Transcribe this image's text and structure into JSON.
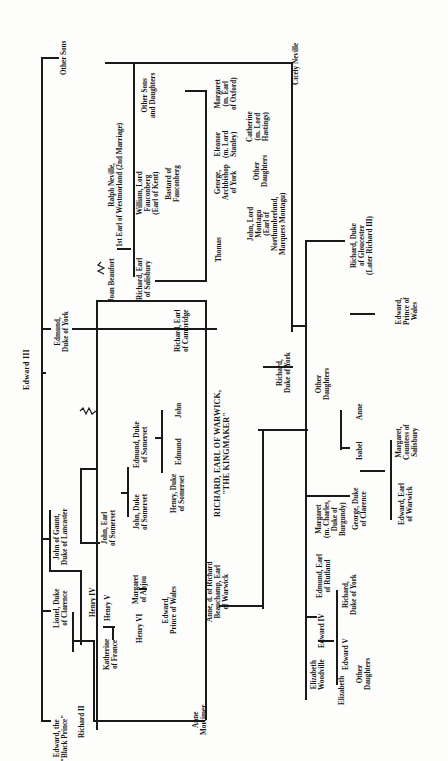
{
  "diagram": {
    "orientation": "rotated 90 degrees counter-clockwise; text reads bottom-to-top",
    "root": "Edward III",
    "people": {
      "edward_iii": "Edward III",
      "other_sons": "Other Sons",
      "edmund_york": "Edmund,\nDuke of York",
      "john_gaunt": "John of Gaunt,\nDuke of Lancaster",
      "lionel": "Lionel, Duke\nof Clarence",
      "black_prince": "Edward, the\n\"Black Prince\"",
      "richard_ii": "Richard II",
      "henry_iv": "Henry IV",
      "henry_v": "Henry V",
      "katherine": "Katherine\nof France",
      "henry_vi": "Henry VI",
      "margaret_anjou": "Margaret\nof Anjou",
      "edward_pow_1": "Edward,\nPrince of Wales",
      "john_somerset": "John, Earl\nof Somerset",
      "john_duke_somerset": "John, Duke\nof Somerset",
      "edmund_duke_somerset": "Edmund, Duke\nof Somerset",
      "henry_duke_somerset": "Henry, Duke\nof Somerset",
      "edmund": "Edmund",
      "john": "John",
      "joan_beaufort": "Joan Beaufort",
      "ralph_neville": "Ralph Neville,\n1st Earl of Westmorland (2nd Marriage)",
      "richard_salisbury": "Richard, Earl\nof Salisbury",
      "william_fauconberg": "William, Lord\nFauconberg\n(Earl of Kent)",
      "bastard_fauconberg": "Bastard of\nFauconberg",
      "other_sons_daughters": "Other Sons\nand Daughters",
      "cecily_neville": "Cicely Neville",
      "thomas": "Thomas",
      "george_archbishop": "George,\nArchbishop\nof York",
      "john_montagu": "John, Lord\nMontagu\n(Earl of\nNorthumberland,\nMarquess Montagu)",
      "eleanor": "Eleanor\n(m. Lord\nStanley)",
      "other_daughters_1": "Other\nDaughters",
      "margaret_oxford": "Margaret\n(m. Earl\nof Oxford)",
      "catherine": "Catherine\n(m. Lord\nHastings)",
      "richard_cambridge": "Richard, Earl\nof Cambridge",
      "anne_mortimer": "Anne\nMortimer",
      "richard_york": "Richard,\nDuke of York",
      "warwick": "RICHARD, EARL OF WARWICK,\n\"THE KINGMAKER\"",
      "anne_beauchamp": "Anne, d. of Richard\nBeauchamp, Earl\nof Warwick",
      "other_daughters_2": "Other\nDaughters",
      "richard_gloucester": "Richard, Duke\nof Gloucester\n(Later Richard III)",
      "edward_pow_2": "Edward,\nPrince of\nWales",
      "anne": "Anne",
      "isabel": "Isabel",
      "margaret_salisbury": "Margaret,\nCountess of\nSalisbury",
      "edward_warwick": "Edward, Earl\nof Warwick",
      "george_clarence": "George, Duke\nof Clarence",
      "margaret_burgundy": "Margaret\n(m. Charles,\nDuke of\nBurgundy)",
      "edmund_rutland": "Edmund, Earl\nof Rutland",
      "edward_iv": "Edward IV",
      "richard_york_2": "Richard,\nDuke of York",
      "elizabeth_woodville": "Elizabeth\nWoodville",
      "edward_v": "Edward V",
      "elizabeth": "Elizabeth",
      "other_daughters_3": "Other\nDaughters"
    }
  }
}
